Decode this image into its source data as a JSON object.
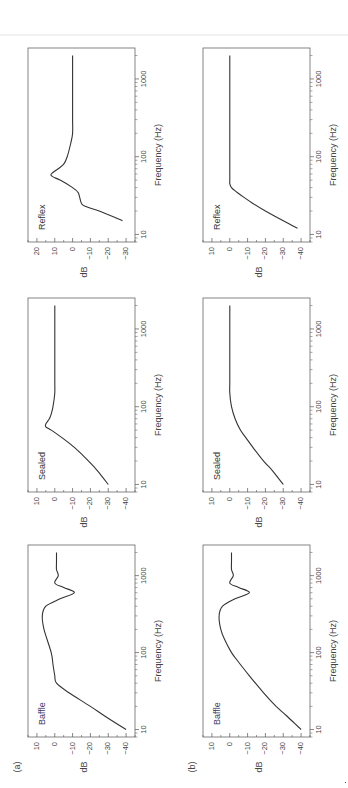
{
  "figure": {
    "rows": [
      {
        "label": "(a)"
      },
      {
        "label": "(b)"
      }
    ],
    "xlabel": "Frequency (Hz)",
    "ylabel": "dB",
    "x_ticks": [
      "10",
      "100",
      "1000"
    ]
  },
  "chart_data": [
    {
      "type": "line",
      "panel": "(a) Baffle",
      "title": "Baffle",
      "xlabel": "Frequency (Hz)",
      "ylabel": "dB",
      "xscale": "log",
      "xlim": [
        8,
        2500
      ],
      "ylim": [
        -45,
        15
      ],
      "yticks": [
        10,
        0,
        -10,
        -20,
        -30,
        -40
      ],
      "x": [
        10,
        15,
        20,
        30,
        40,
        50,
        70,
        100,
        200,
        300,
        400,
        500,
        600,
        700,
        800,
        1000,
        1200,
        1500,
        2000
      ],
      "y": [
        -40,
        -28,
        -20,
        -8,
        -1,
        0,
        1,
        2,
        6,
        7,
        5,
        -3,
        -11,
        -5,
        0,
        -2,
        -1,
        -1,
        -1
      ]
    },
    {
      "type": "line",
      "panel": "(a) Sealed",
      "title": "Sealed",
      "xlabel": "Frequency (Hz)",
      "ylabel": "dB",
      "xscale": "log",
      "xlim": [
        8,
        2500
      ],
      "ylim": [
        -45,
        15
      ],
      "yticks": [
        10,
        0,
        -10,
        -20,
        -30,
        -40
      ],
      "x": [
        10,
        15,
        20,
        30,
        40,
        50,
        55,
        60,
        70,
        80,
        100,
        150,
        200,
        300,
        500,
        1000,
        2000
      ],
      "y": [
        -30,
        -24,
        -19,
        -11,
        -4,
        2,
        5,
        5,
        3,
        2,
        1,
        0,
        0,
        0,
        0,
        0,
        0
      ]
    },
    {
      "type": "line",
      "panel": "(a) Reflex",
      "title": "Reflex",
      "xlabel": "Frequency (Hz)",
      "ylabel": "dB",
      "xscale": "log",
      "xlim": [
        8,
        2500
      ],
      "ylim": [
        -35,
        25
      ],
      "yticks": [
        20,
        10,
        0,
        -10,
        -20,
        -30
      ],
      "x": [
        15,
        20,
        23,
        25,
        30,
        35,
        40,
        50,
        55,
        60,
        70,
        80,
        100,
        150,
        200,
        300,
        500,
        1000,
        2000
      ],
      "y": [
        -28,
        -15,
        -7,
        -5,
        -4,
        -3,
        0,
        7,
        11,
        12,
        8,
        5,
        3,
        1,
        0,
        0,
        0,
        0,
        0
      ]
    },
    {
      "type": "line",
      "panel": "(b) Baffle",
      "title": "Baffle",
      "xlabel": "Frequency (Hz)",
      "ylabel": "dB",
      "xscale": "log",
      "xlim": [
        8,
        2500
      ],
      "ylim": [
        -45,
        15
      ],
      "yticks": [
        10,
        0,
        -10,
        -20,
        -30,
        -40
      ],
      "x": [
        10,
        15,
        20,
        30,
        50,
        70,
        100,
        150,
        200,
        300,
        400,
        500,
        600,
        700,
        800,
        1000,
        1200,
        1500,
        2000
      ],
      "y": [
        -40,
        -32,
        -26,
        -19,
        -11,
        -6,
        -1,
        3,
        5,
        6,
        4,
        -3,
        -11,
        -5,
        0,
        -2,
        -1,
        -1,
        -1
      ]
    },
    {
      "type": "line",
      "panel": "(b) Sealed",
      "title": "Sealed",
      "xlabel": "Frequency (Hz)",
      "ylabel": "dB",
      "xscale": "log",
      "xlim": [
        8,
        2500
      ],
      "ylim": [
        -45,
        15
      ],
      "yticks": [
        10,
        0,
        -10,
        -20,
        -30,
        -40
      ],
      "x": [
        10,
        15,
        20,
        30,
        40,
        50,
        70,
        100,
        150,
        200,
        300,
        500,
        1000,
        2000
      ],
      "y": [
        -30,
        -24,
        -19,
        -13,
        -9,
        -6,
        -3,
        -1,
        0,
        0,
        0,
        0,
        0,
        0
      ]
    },
    {
      "type": "line",
      "panel": "(b) Reflex",
      "title": "Reflex",
      "xlabel": "Frequency (Hz)",
      "ylabel": "dB",
      "xscale": "log",
      "xlim": [
        8,
        2500
      ],
      "ylim": [
        -45,
        15
      ],
      "yticks": [
        10,
        0,
        -10,
        -20,
        -30,
        -40
      ],
      "x": [
        12,
        15,
        20,
        25,
        30,
        35,
        40,
        45,
        50,
        100,
        200,
        500,
        1000,
        2000
      ],
      "y": [
        -38,
        -30,
        -20,
        -13,
        -8,
        -4,
        -1,
        0,
        0,
        0,
        0,
        0,
        0,
        0
      ]
    }
  ]
}
